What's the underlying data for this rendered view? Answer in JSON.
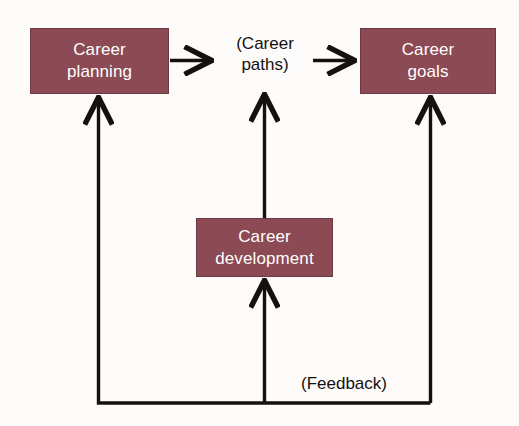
{
  "diagram": {
    "background_color": "#fdfcfb",
    "box_fill_color": "#8b4a54",
    "box_text_color": "#ffffff",
    "line_color": "#14110f",
    "nodes": [
      {
        "id": "career-planning",
        "label": "Career\nplanning",
        "type": "box"
      },
      {
        "id": "career-paths",
        "label": "(Career\npaths)",
        "type": "plain-text"
      },
      {
        "id": "career-goals",
        "label": "Career\ngoals",
        "type": "box"
      },
      {
        "id": "career-development",
        "label": "Career\ndevelopment",
        "type": "box"
      },
      {
        "id": "feedback",
        "label": "(Feedback)",
        "type": "plain-text"
      }
    ],
    "edges": [
      {
        "id": "planning-to-paths",
        "from": "career-planning",
        "to": "career-paths",
        "direction": "right"
      },
      {
        "id": "paths-to-goals",
        "from": "career-paths",
        "to": "career-goals",
        "direction": "right"
      },
      {
        "id": "development-to-paths",
        "from": "career-development",
        "to": "career-paths",
        "direction": "up"
      },
      {
        "id": "feedback-to-planning",
        "from": "feedback",
        "to": "career-planning",
        "direction": "up"
      },
      {
        "id": "feedback-to-development",
        "from": "feedback",
        "to": "career-development",
        "direction": "up"
      },
      {
        "id": "goals-to-feedback",
        "from": "career-goals",
        "to": "feedback",
        "direction": "up"
      }
    ]
  }
}
